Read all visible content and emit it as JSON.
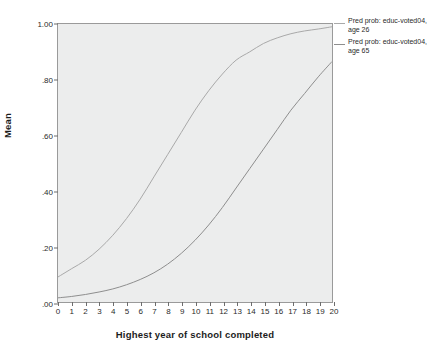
{
  "chart_data": {
    "type": "line",
    "title": "",
    "xlabel": "Highest year of school completed",
    "ylabel": "Mean",
    "xlim": [
      0,
      20
    ],
    "ylim": [
      0.0,
      1.0
    ],
    "grid": false,
    "legend_position": "right",
    "x_tick_labels": [
      "0",
      "1",
      "2",
      "3",
      "4",
      "5",
      "6",
      "7",
      "8",
      "9",
      "10",
      "11",
      "12",
      "13",
      "14",
      "15",
      "16",
      "17",
      "18",
      "19",
      "20"
    ],
    "y_tick_labels": [
      "1.00",
      ".80",
      ".60",
      ".40",
      ".20",
      ".00"
    ],
    "y_tick_values": [
      1.0,
      0.8,
      0.6,
      0.4,
      0.2,
      0.0
    ],
    "x": [
      0,
      1,
      2,
      3,
      4,
      5,
      6,
      7,
      8,
      9,
      10,
      11,
      12,
      13,
      14,
      15,
      16,
      17,
      18,
      19,
      20
    ],
    "series": [
      {
        "name": "Pred prob: educ-voted04,\nage 26",
        "color": "#a9a9a9",
        "values": [
          0.09,
          0.12,
          0.15,
          0.19,
          0.24,
          0.3,
          0.37,
          0.45,
          0.53,
          0.61,
          0.69,
          0.76,
          0.82,
          0.87,
          0.9,
          0.93,
          0.95,
          0.965,
          0.975,
          0.982,
          0.99
        ]
      },
      {
        "name": "Pred prob: educ-voted04,\nage 65",
        "color": "#8e8e8e",
        "values": [
          0.015,
          0.02,
          0.027,
          0.036,
          0.047,
          0.062,
          0.081,
          0.105,
          0.136,
          0.175,
          0.222,
          0.277,
          0.34,
          0.41,
          0.48,
          0.55,
          0.62,
          0.69,
          0.75,
          0.81,
          0.865
        ]
      }
    ]
  },
  "legend": [
    {
      "label": "Pred prob: educ-voted04,\nage 26",
      "color": "#a9a9a9"
    },
    {
      "label": "Pred prob: educ-voted04,\nage 65",
      "color": "#8e8e8e"
    }
  ],
  "axes": {
    "y_title": "Mean",
    "x_title": "Highest year of school completed",
    "y_ticks": [
      {
        "label": "1.00",
        "value": 1.0
      },
      {
        "label": ".80",
        "value": 0.8
      },
      {
        "label": ".60",
        "value": 0.6
      },
      {
        "label": ".40",
        "value": 0.4
      },
      {
        "label": ".20",
        "value": 0.2
      },
      {
        "label": ".00",
        "value": 0.0
      }
    ],
    "x_ticks": [
      {
        "label": "0",
        "value": 0
      },
      {
        "label": "1",
        "value": 1
      },
      {
        "label": "2",
        "value": 2
      },
      {
        "label": "3",
        "value": 3
      },
      {
        "label": "4",
        "value": 4
      },
      {
        "label": "5",
        "value": 5
      },
      {
        "label": "6",
        "value": 6
      },
      {
        "label": "7",
        "value": 7
      },
      {
        "label": "8",
        "value": 8
      },
      {
        "label": "9",
        "value": 9
      },
      {
        "label": "10",
        "value": 10
      },
      {
        "label": "11",
        "value": 11
      },
      {
        "label": "12",
        "value": 12
      },
      {
        "label": "13",
        "value": 13
      },
      {
        "label": "14",
        "value": 14
      },
      {
        "label": "15",
        "value": 15
      },
      {
        "label": "16",
        "value": 16
      },
      {
        "label": "17",
        "value": 17
      },
      {
        "label": "18",
        "value": 18
      },
      {
        "label": "19",
        "value": 19
      },
      {
        "label": "20",
        "value": 20
      }
    ]
  },
  "colors": {
    "plot_background": "#eceded",
    "frame_border": "#9a9a9a",
    "page_background": "#ffffff",
    "tick": "#6d6d6d"
  }
}
